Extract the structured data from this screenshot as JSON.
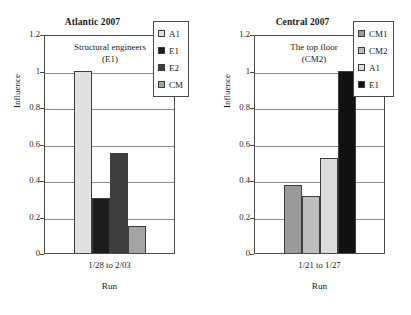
{
  "chart_data": [
    {
      "type": "bar",
      "title": "Atlantic 2007",
      "xlabel": "Run",
      "ylabel": "Influence",
      "ylim": [
        0,
        1.2
      ],
      "yticks": [
        "0",
        "0.2",
        "0.4",
        "0.6",
        "0.8",
        "1",
        "1.2"
      ],
      "ytick_values": [
        0,
        0.2,
        0.4,
        0.6,
        0.8,
        1,
        1.2
      ],
      "grid": true,
      "legend_position": "top-right",
      "categories": [
        "1/28 to 2/03"
      ],
      "annotation": [
        "Structural engineers",
        "(E1)"
      ],
      "series": [
        {
          "name": "A1",
          "values": [
            1.0
          ],
          "color": "#e0e0e0"
        },
        {
          "name": "E1",
          "values": [
            0.3
          ],
          "color": "#1c1c1c"
        },
        {
          "name": "E2",
          "values": [
            0.55
          ],
          "color": "#3f3f3f"
        },
        {
          "name": "CM",
          "values": [
            0.15
          ],
          "color": "#a3a3a3"
        }
      ]
    },
    {
      "type": "bar",
      "title": "Central 2007",
      "xlabel": "Run",
      "ylabel": "Influence",
      "ylim": [
        0,
        1.2
      ],
      "yticks": [
        "0",
        "0.2",
        "0.4",
        "0.6",
        "0.8",
        "1",
        "1.2"
      ],
      "ytick_values": [
        0,
        0.2,
        0.4,
        0.6,
        0.8,
        1,
        1.2
      ],
      "grid": true,
      "legend_position": "top-right",
      "categories": [
        "1/21 to 1/27"
      ],
      "annotation": [
        "The top floor",
        "(CM2)"
      ],
      "series": [
        {
          "name": "CM1",
          "values": [
            0.37
          ],
          "color": "#9a9a9a"
        },
        {
          "name": "CM2",
          "values": [
            0.31
          ],
          "color": "#bdbdbd"
        },
        {
          "name": "A1",
          "values": [
            0.52
          ],
          "color": "#dcdcdc"
        },
        {
          "name": "E1",
          "values": [
            1.0
          ],
          "color": "#111111"
        }
      ]
    }
  ],
  "style": {
    "axis_color": "#4a4a4a",
    "grid_color": "#8c8c8c",
    "text_color": "#1a1a1a",
    "background": "#ffffff"
  }
}
